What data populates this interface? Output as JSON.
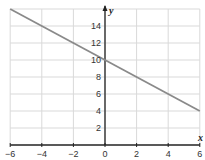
{
  "chart_data": {
    "type": "line",
    "title": "",
    "xlabel": "x",
    "ylabel": "y",
    "xlim": [
      -6,
      6
    ],
    "ylim": [
      0,
      16
    ],
    "grid": true,
    "x_ticks": [
      "-6",
      "-4",
      "-2",
      "0",
      "2",
      "4",
      "6"
    ],
    "y_ticks": [
      "2",
      "4",
      "6",
      "8",
      "10",
      "12",
      "14"
    ],
    "series": [
      {
        "name": "line",
        "x": [
          -6,
          6
        ],
        "y": [
          16,
          4
        ],
        "equation": "y = -x + 10"
      }
    ]
  },
  "colors": {
    "grid": "#d9d9d9",
    "axis": "#222222",
    "line": "#8a8a8a"
  }
}
